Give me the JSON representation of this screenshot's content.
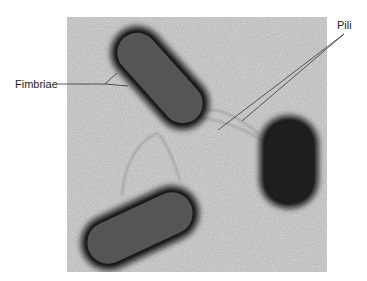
{
  "figure": {
    "type": "electron-micrograph",
    "labels": {
      "fimbriae": "Fimbriae",
      "pili": "Pili"
    },
    "colors": {
      "background": "#ffffff",
      "micrograph_field": "#d8d8d6",
      "cell_body": "#555555",
      "cell_body_dark": "#1e1e1e",
      "cell_halo": "#111111",
      "appendage": "#9a9a9a",
      "leader_line": "#333333",
      "label_text": "#222222"
    },
    "cells": [
      {
        "name": "upper-left-rod",
        "shade": "medium"
      },
      {
        "name": "lower-left-rod",
        "shade": "medium"
      },
      {
        "name": "right-rod",
        "shade": "dark"
      }
    ]
  }
}
